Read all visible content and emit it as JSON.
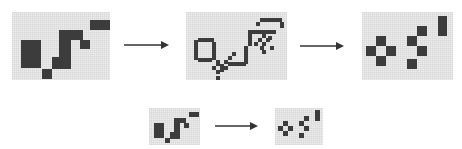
{
  "diagram": {
    "colors": {
      "grid_bg": "#e6e6e6",
      "grid_line": "#c8c8c8",
      "cell_dark": "#3c3c3c",
      "arrow": "#333333"
    },
    "top_row": {
      "panels": [
        {
          "id": "initial-pattern",
          "x": 12,
          "y": 12,
          "w": 98,
          "h": 68,
          "cells": [
            [
              9,
              28,
              20,
              28
            ],
            [
              30,
              57,
              10,
              10
            ],
            [
              40,
              45,
              19,
              12
            ],
            [
              47,
              18,
              12,
              28
            ],
            [
              59,
              18,
              12,
              10
            ],
            [
              68,
              28,
              10,
              9
            ],
            [
              78,
              8,
              20,
              10
            ]
          ]
        },
        {
          "id": "intermediate-pattern",
          "x": 186,
          "y": 12,
          "w": 101,
          "h": 68,
          "cells": [
            [
              8,
              28,
              4,
              20
            ],
            [
              12,
              26,
              16,
              4
            ],
            [
              12,
              46,
              14,
              4
            ],
            [
              26,
              30,
              4,
              18
            ],
            [
              30,
              48,
              4,
              6
            ],
            [
              34,
              52,
              4,
              6
            ],
            [
              38,
              48,
              4,
              4
            ],
            [
              42,
              44,
              4,
              4
            ],
            [
              46,
              40,
              4,
              4
            ],
            [
              26,
              54,
              4,
              4
            ],
            [
              30,
              58,
              4,
              4
            ],
            [
              34,
              56,
              4,
              4
            ],
            [
              30,
              64,
              4,
              4
            ],
            [
              38,
              54,
              4,
              4
            ],
            [
              42,
              50,
              18,
              4
            ],
            [
              58,
              38,
              4,
              14
            ],
            [
              58,
              34,
              4,
              4
            ],
            [
              62,
              18,
              4,
              16
            ],
            [
              66,
              18,
              24,
              4
            ],
            [
              76,
              22,
              4,
              4
            ],
            [
              82,
              24,
              4,
              4
            ],
            [
              72,
              26,
              4,
              4
            ],
            [
              68,
              30,
              4,
              4
            ],
            [
              76,
              30,
              4,
              4
            ],
            [
              80,
              26,
              4,
              4
            ],
            [
              74,
              34,
              4,
              4
            ],
            [
              84,
              34,
              4,
              4
            ],
            [
              76,
              38,
              4,
              4
            ],
            [
              70,
              10,
              4,
              4
            ],
            [
              74,
              6,
              22,
              4
            ],
            [
              94,
              10,
              4,
              6
            ]
          ]
        },
        {
          "id": "final-pattern",
          "x": 362,
          "y": 12,
          "w": 91,
          "h": 68,
          "cells": [
            [
              14,
              24,
              10,
              10
            ],
            [
              4,
              34,
              10,
              10
            ],
            [
              24,
              34,
              10,
              10
            ],
            [
              14,
              44,
              10,
              10
            ],
            [
              45,
              24,
              10,
              10
            ],
            [
              55,
              14,
              10,
              10
            ],
            [
              55,
              34,
              10,
              10
            ],
            [
              45,
              47,
              10,
              10
            ],
            [
              76,
              4,
              9,
              20
            ]
          ]
        }
      ],
      "arrows": [
        {
          "id": "arrow-1",
          "x1": 124,
          "x2": 173,
          "y": 45
        },
        {
          "id": "arrow-2",
          "x1": 300,
          "x2": 348,
          "y": 46
        }
      ]
    },
    "bottom_row": {
      "panels": [
        {
          "id": "small-initial-pattern",
          "x": 149,
          "y": 108,
          "w": 51,
          "h": 37,
          "cells": [
            [
              5,
              15,
              10,
              15
            ],
            [
              16,
              30,
              5,
              5
            ],
            [
              21,
              24,
              10,
              7
            ],
            [
              25,
              10,
              6,
              15
            ],
            [
              31,
              10,
              6,
              5
            ],
            [
              35,
              15,
              5,
              5
            ],
            [
              40,
              4,
              10,
              5
            ]
          ]
        },
        {
          "id": "small-final-pattern",
          "x": 275,
          "y": 108,
          "w": 48,
          "h": 37,
          "cells": [
            [
              8,
              13,
              5,
              5
            ],
            [
              3,
              18,
              5,
              5
            ],
            [
              13,
              18,
              5,
              5
            ],
            [
              8,
              23,
              5,
              5
            ],
            [
              24,
              13,
              5,
              5
            ],
            [
              29,
              8,
              5,
              5
            ],
            [
              29,
              18,
              5,
              5
            ],
            [
              24,
              25,
              5,
              5
            ],
            [
              40,
              2,
              5,
              11
            ]
          ]
        }
      ],
      "arrows": [
        {
          "id": "arrow-3",
          "x1": 215,
          "x2": 262,
          "y": 126
        }
      ]
    }
  }
}
